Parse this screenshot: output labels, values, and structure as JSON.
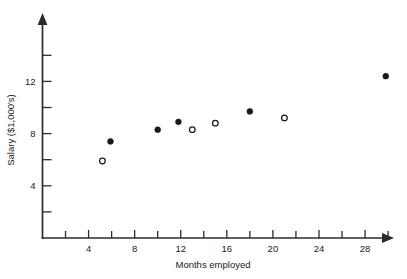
{
  "chart_data": {
    "type": "scatter",
    "title": "",
    "xlabel": "Months employed",
    "ylabel": "Salary ($1,000's)",
    "xlim": [
      0,
      31.5
    ],
    "ylim": [
      0,
      14.3
    ],
    "grid": false,
    "legend": null,
    "x_ticks_labeled": [
      4,
      8,
      12,
      16,
      20,
      24,
      28
    ],
    "x_tick_labels": [
      "4",
      "8",
      "12",
      "16",
      "20",
      "24",
      "28"
    ],
    "x_ticks_all": [
      2,
      4,
      6,
      8,
      10,
      12,
      14,
      16,
      18,
      20,
      22,
      24,
      26,
      28,
      30
    ],
    "y_ticks_labeled": [
      4,
      8,
      12
    ],
    "y_tick_labels": [
      "4",
      "8",
      "12"
    ],
    "y_ticks_all": [
      2,
      4,
      6,
      8,
      10,
      12,
      14
    ],
    "series": [
      {
        "name": "filled",
        "marker": "filled-circle",
        "color": "#1a1a1a",
        "points": [
          {
            "x": 5.9,
            "y": 7.4
          },
          {
            "x": 10.0,
            "y": 8.3
          },
          {
            "x": 11.8,
            "y": 8.9
          },
          {
            "x": 18.0,
            "y": 9.7
          },
          {
            "x": 29.8,
            "y": 12.4
          }
        ]
      },
      {
        "name": "open",
        "marker": "open-circle",
        "color": "#1a1a1a",
        "points": [
          {
            "x": 5.2,
            "y": 5.9
          },
          {
            "x": 13.0,
            "y": 8.3
          },
          {
            "x": 15.0,
            "y": 8.8
          },
          {
            "x": 21.0,
            "y": 9.2
          }
        ]
      }
    ]
  },
  "colors": {
    "axis": "#2b2b2b",
    "text": "#1a1a1a",
    "background": "#ffffff",
    "marker": "#1a1a1a"
  }
}
